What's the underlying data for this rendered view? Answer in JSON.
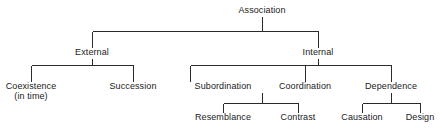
{
  "diagram": {
    "type": "hierarchy-tree",
    "line_color": "#2b2b2b",
    "text_color": "#1a1a1a",
    "background_color": "#ffffff",
    "levels": 4,
    "nodes": {
      "root": {
        "label": "Association",
        "x": 262,
        "y": 12,
        "level": 0
      },
      "external": {
        "label": "External",
        "x": 92,
        "y": 54,
        "level": 1
      },
      "internal": {
        "label": "Internal",
        "x": 318,
        "y": 54,
        "level": 1
      },
      "coexistence": {
        "label": "Coexistence",
        "sublabel": "(in time)",
        "x": 31,
        "y": 88,
        "level": 2
      },
      "succession": {
        "label": "Succession",
        "x": 133,
        "y": 88,
        "level": 2
      },
      "subordination": {
        "label": "Subordination",
        "x": 223,
        "y": 88,
        "level": 2
      },
      "coordination": {
        "label": "Coordination",
        "x": 305,
        "y": 88,
        "level": 2
      },
      "dependence": {
        "label": "Dependence",
        "x": 391,
        "y": 88,
        "level": 2
      },
      "resemblance": {
        "label": "Resemblance",
        "x": 223,
        "y": 119,
        "level": 3
      },
      "contrast": {
        "label": "Contrast",
        "x": 298,
        "y": 119,
        "level": 3
      },
      "causation": {
        "label": "Causation",
        "x": 362,
        "y": 119,
        "level": 3
      },
      "design": {
        "label": "Design",
        "x": 420,
        "y": 119,
        "level": 3
      }
    },
    "edges": [
      {
        "from": "root",
        "to": "external"
      },
      {
        "from": "root",
        "to": "internal"
      },
      {
        "from": "external",
        "to": "coexistence"
      },
      {
        "from": "external",
        "to": "succession"
      },
      {
        "from": "internal",
        "to": "subordination"
      },
      {
        "from": "internal",
        "to": "coordination"
      },
      {
        "from": "internal",
        "to": "dependence"
      },
      {
        "from": "coordination",
        "to": "resemblance"
      },
      {
        "from": "coordination",
        "to": "contrast"
      },
      {
        "from": "dependence",
        "to": "causation"
      },
      {
        "from": "dependence",
        "to": "design"
      }
    ]
  }
}
